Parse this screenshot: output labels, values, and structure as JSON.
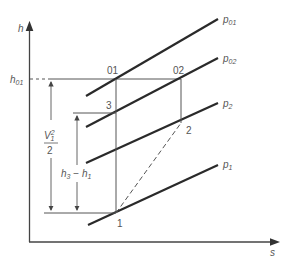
{
  "diagram": {
    "type": "h-s (enthalpy-entropy) diagram, compressor stage",
    "axes": {
      "y_label": "h",
      "x_label": "s"
    },
    "reference_label": {
      "main": "h",
      "sub": "01"
    },
    "isobars": [
      {
        "main": "p",
        "sub": "01"
      },
      {
        "main": "p",
        "sub": "02"
      },
      {
        "main": "p",
        "sub": "2"
      },
      {
        "main": "p",
        "sub": "1"
      }
    ],
    "points": {
      "p01": "01",
      "p02": "02",
      "p3": "3",
      "p2": "2",
      "p1": "1"
    },
    "annotations": {
      "velocity_head": {
        "numerator_main": "V",
        "numerator_sub": "1",
        "numerator_sup": "2",
        "denominator": "2"
      },
      "enthalpy_diff": {
        "a_main": "h",
        "a_sub": "3",
        "op": " − ",
        "b_main": "h",
        "b_sub": "1"
      }
    },
    "colors": {
      "line": "#2a2a2a",
      "thin_line": "#555555",
      "text": "#555555"
    }
  }
}
